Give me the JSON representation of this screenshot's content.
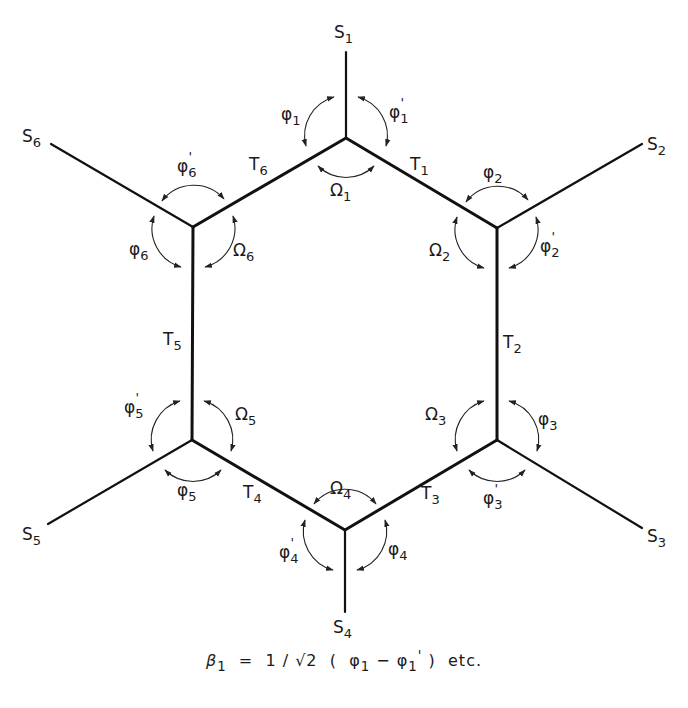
{
  "diagram": {
    "type": "hexagonal ring internal coordinates",
    "substituents": [
      "S1",
      "S2",
      "S3",
      "S4",
      "S5",
      "S6"
    ],
    "ring_bonds": [
      "T1",
      "T2",
      "T3",
      "T4",
      "T5",
      "T6"
    ],
    "ring_angles": [
      "Ω1",
      "Ω2",
      "Ω3",
      "Ω4",
      "Ω5",
      "Ω6"
    ],
    "phi_angles": [
      "φ1",
      "φ2",
      "φ3",
      "φ4",
      "φ5",
      "φ6"
    ],
    "phi_prime_angles": [
      "φ1'",
      "φ2'",
      "φ3'",
      "φ4'",
      "φ5'",
      "φ6'"
    ],
    "caption": {
      "beta": "β",
      "beta_sub": "1",
      "eq": "=",
      "factor": "1 / √2",
      "open": "(",
      "phi1": "φ",
      "phi1_sub": "1",
      "minus": "−",
      "phi1p": "φ",
      "phi1p_sub": "1",
      "phi1p_prime": "'",
      "close": ")",
      "etc": "etc."
    }
  },
  "labels": {
    "S1": {
      "main": "S",
      "sub": "1"
    },
    "S2": {
      "main": "S",
      "sub": "2"
    },
    "S3": {
      "main": "S",
      "sub": "3"
    },
    "S4": {
      "main": "S",
      "sub": "4"
    },
    "S5": {
      "main": "S",
      "sub": "5"
    },
    "S6": {
      "main": "S",
      "sub": "6"
    },
    "T1": {
      "main": "T",
      "sub": "1"
    },
    "T2": {
      "main": "T",
      "sub": "2"
    },
    "T3": {
      "main": "T",
      "sub": "3"
    },
    "T4": {
      "main": "T",
      "sub": "4"
    },
    "T5": {
      "main": "T",
      "sub": "5"
    },
    "T6": {
      "main": "T",
      "sub": "6"
    },
    "O1": {
      "main": "Ω",
      "sub": "1"
    },
    "O2": {
      "main": "Ω",
      "sub": "2"
    },
    "O3": {
      "main": "Ω",
      "sub": "3"
    },
    "O4": {
      "main": "Ω",
      "sub": "4"
    },
    "O5": {
      "main": "Ω",
      "sub": "5"
    },
    "O6": {
      "main": "Ω",
      "sub": "6"
    },
    "P1": {
      "main": "φ",
      "sub": "1"
    },
    "P2": {
      "main": "φ",
      "sub": "2"
    },
    "P3": {
      "main": "φ",
      "sub": "3"
    },
    "P4": {
      "main": "φ",
      "sub": "4"
    },
    "P5": {
      "main": "φ",
      "sub": "5"
    },
    "P6": {
      "main": "φ",
      "sub": "6"
    },
    "Q1": {
      "main": "φ",
      "sub": "1",
      "prime": "'"
    },
    "Q2": {
      "main": "φ",
      "sub": "2",
      "prime": "'"
    },
    "Q3": {
      "main": "φ",
      "sub": "3",
      "prime": "'"
    },
    "Q4": {
      "main": "φ",
      "sub": "4",
      "prime": "'"
    },
    "Q5": {
      "main": "φ",
      "sub": "5",
      "prime": "'"
    },
    "Q6": {
      "main": "φ",
      "sub": "6",
      "prime": "'"
    }
  }
}
